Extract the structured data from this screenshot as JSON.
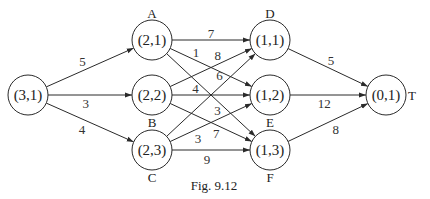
{
  "diagram": {
    "caption": "Fig. 9.12",
    "nodes": [
      {
        "id": "S",
        "label": "(3,1)",
        "name": ""
      },
      {
        "id": "A",
        "label": "(2,1)",
        "name": "A"
      },
      {
        "id": "B",
        "label": "(2,2)",
        "name": "B"
      },
      {
        "id": "C",
        "label": "(2,3)",
        "name": "C"
      },
      {
        "id": "D",
        "label": "(1,1)",
        "name": "D"
      },
      {
        "id": "E",
        "label": "(1,2)",
        "name": "E"
      },
      {
        "id": "F",
        "label": "(1,3)",
        "name": "F"
      },
      {
        "id": "T",
        "label": "(0,1)",
        "name": "T"
      }
    ],
    "edges": [
      {
        "from": "S",
        "to": "A",
        "weight": "5"
      },
      {
        "from": "S",
        "to": "B",
        "weight": "3"
      },
      {
        "from": "S",
        "to": "C",
        "weight": "4"
      },
      {
        "from": "A",
        "to": "D",
        "weight": "7"
      },
      {
        "from": "A",
        "to": "E",
        "weight": "1"
      },
      {
        "from": "A",
        "to": "F",
        "weight": "3"
      },
      {
        "from": "B",
        "to": "D",
        "weight": "8"
      },
      {
        "from": "B",
        "to": "E",
        "weight": "4"
      },
      {
        "from": "B",
        "to": "F",
        "weight": "7"
      },
      {
        "from": "C",
        "to": "D",
        "weight": "6"
      },
      {
        "from": "C",
        "to": "E",
        "weight": "3"
      },
      {
        "from": "C",
        "to": "F",
        "weight": "9"
      },
      {
        "from": "D",
        "to": "T",
        "weight": "5"
      },
      {
        "from": "E",
        "to": "T",
        "weight": "12"
      },
      {
        "from": "F",
        "to": "T",
        "weight": "8"
      }
    ]
  }
}
